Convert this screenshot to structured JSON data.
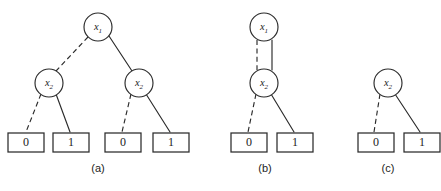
{
  "figure": {
    "background_color": "#ffffff",
    "stroke_color": "#2b2b2b",
    "panels": [
      {
        "id": "panel-a",
        "caption": "(a)",
        "caption_x": 98,
        "caption_y": 169,
        "nodes": [
          {
            "id": "a-root",
            "var": "x",
            "sub": "1",
            "cx": 98,
            "cy": 27,
            "r": 14
          },
          {
            "id": "a-left",
            "var": "x",
            "sub": "2",
            "cx": 49,
            "cy": 83,
            "r": 14
          },
          {
            "id": "a-right",
            "var": "x",
            "sub": "2",
            "cx": 139,
            "cy": 83,
            "r": 14
          }
        ],
        "leaves": [
          {
            "id": "a-leaf-0a",
            "value": "0",
            "x": 8,
            "y": 133,
            "w": 36,
            "h": 19
          },
          {
            "id": "a-leaf-1a",
            "value": "1",
            "x": 53,
            "y": 133,
            "w": 36,
            "h": 19
          },
          {
            "id": "a-leaf-0b",
            "value": "0",
            "x": 105,
            "y": 133,
            "w": 36,
            "h": 19
          },
          {
            "id": "a-leaf-1b",
            "value": "1",
            "x": 153,
            "y": 133,
            "w": 36,
            "h": 19
          }
        ],
        "edges": [
          {
            "id": "a-edge-root-low",
            "style": "dashed",
            "x1": 88,
            "y1": 37,
            "x2": 56,
            "y2": 71
          },
          {
            "id": "a-edge-root-high",
            "style": "solid",
            "x1": 109,
            "y1": 36,
            "x2": 132,
            "y2": 71
          },
          {
            "id": "a-edge-left-low",
            "style": "dashed",
            "x1": 41,
            "y1": 94,
            "x2": 26,
            "y2": 132
          },
          {
            "id": "a-edge-left-high",
            "style": "solid",
            "x1": 56,
            "y1": 94,
            "x2": 70,
            "y2": 132
          },
          {
            "id": "a-edge-right-low",
            "style": "dashed",
            "x1": 131,
            "y1": 94,
            "x2": 122,
            "y2": 132
          },
          {
            "id": "a-edge-right-high",
            "style": "solid",
            "x1": 146,
            "y1": 94,
            "x2": 170,
            "y2": 132
          }
        ]
      },
      {
        "id": "panel-b",
        "caption": "(b)",
        "caption_x": 265,
        "caption_y": 169,
        "nodes": [
          {
            "id": "b-root",
            "var": "x",
            "sub": "1",
            "cx": 264,
            "cy": 27,
            "r": 14
          },
          {
            "id": "b-mid",
            "var": "x",
            "sub": "2",
            "cx": 264,
            "cy": 83,
            "r": 14
          }
        ],
        "leaves": [
          {
            "id": "b-leaf-0",
            "value": "0",
            "x": 231,
            "y": 133,
            "w": 36,
            "h": 19
          },
          {
            "id": "b-leaf-1",
            "value": "1",
            "x": 277,
            "y": 133,
            "w": 36,
            "h": 19
          }
        ],
        "edges": [
          {
            "id": "b-edge-root-low",
            "style": "dashed",
            "x1": 257,
            "y1": 40,
            "x2": 257,
            "y2": 70
          },
          {
            "id": "b-edge-root-high",
            "style": "solid",
            "x1": 272,
            "y1": 40,
            "x2": 272,
            "y2": 70
          },
          {
            "id": "b-edge-mid-low",
            "style": "dashed",
            "x1": 256,
            "y1": 94,
            "x2": 248,
            "y2": 132
          },
          {
            "id": "b-edge-mid-high",
            "style": "solid",
            "x1": 271,
            "y1": 94,
            "x2": 294,
            "y2": 132
          }
        ]
      },
      {
        "id": "panel-c",
        "caption": "(c)",
        "caption_x": 388,
        "caption_y": 169,
        "nodes": [
          {
            "id": "c-root",
            "var": "x",
            "sub": "2",
            "cx": 388,
            "cy": 83,
            "r": 14
          }
        ],
        "leaves": [
          {
            "id": "c-leaf-0",
            "value": "0",
            "x": 358,
            "y": 133,
            "w": 36,
            "h": 19
          },
          {
            "id": "c-leaf-1",
            "value": "1",
            "x": 404,
            "y": 133,
            "w": 36,
            "h": 19
          }
        ],
        "edges": [
          {
            "id": "c-edge-low",
            "style": "dashed",
            "x1": 380,
            "y1": 94,
            "x2": 374,
            "y2": 132
          },
          {
            "id": "c-edge-high",
            "style": "solid",
            "x1": 395,
            "y1": 94,
            "x2": 420,
            "y2": 132
          }
        ]
      }
    ]
  }
}
